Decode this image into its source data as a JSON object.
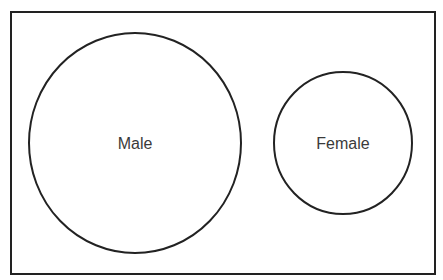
{
  "diagram": {
    "type": "venn",
    "frame": {
      "x": 11,
      "y": 12,
      "width": 424,
      "height": 262,
      "stroke": "#222222"
    },
    "sets": [
      {
        "id": "male",
        "label": "Male",
        "cx": 135,
        "cy": 143,
        "rx": 106,
        "ry": 110,
        "stroke": "#222222"
      },
      {
        "id": "female",
        "label": "Female",
        "cx": 343,
        "cy": 143,
        "rx": 69,
        "ry": 71,
        "stroke": "#222222"
      }
    ],
    "overlap": false
  }
}
